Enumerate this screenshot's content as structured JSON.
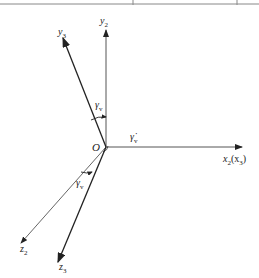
{
  "diagram": {
    "type": "coordinate-frame-rotation",
    "origin_label": "O",
    "axes": [
      {
        "id": "y2",
        "label": "y",
        "subscript": "2"
      },
      {
        "id": "y3",
        "label": "y",
        "subscript": "3"
      },
      {
        "id": "x2x3",
        "label": "x",
        "subscript": "2",
        "suffix": "(x",
        "suffix_sub": "3",
        "suffix_end": ")"
      },
      {
        "id": "z2",
        "label": "z",
        "subscript": "2"
      },
      {
        "id": "z3",
        "label": "z",
        "subscript": "3"
      }
    ],
    "angles": [
      {
        "id": "gamma-v-upper",
        "label": "γ",
        "subscript": "v"
      },
      {
        "id": "gamma-v-lower",
        "label": "γ",
        "subscript": "v"
      }
    ],
    "rate": {
      "label": "γ̇",
      "subscript": "v"
    },
    "colors": {
      "line": "#222222",
      "light_line": "#888888",
      "background": "#ffffff"
    }
  }
}
